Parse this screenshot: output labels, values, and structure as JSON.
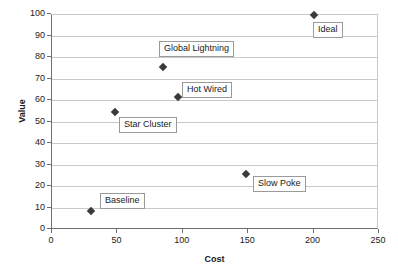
{
  "chart_data": {
    "type": "scatter",
    "title": "",
    "xlabel": "Cost",
    "ylabel": "Value",
    "xlim": [
      0,
      250
    ],
    "ylim": [
      0,
      100
    ],
    "xticks": [
      0,
      50,
      100,
      150,
      200,
      250
    ],
    "yticks": [
      0,
      10,
      20,
      30,
      40,
      50,
      60,
      70,
      80,
      90,
      100
    ],
    "grid": "horizontal",
    "legend": "none",
    "marker_color": "#3a3a3a",
    "gridline_color": "#c9c9c9",
    "axis_color": "#6e6e6e",
    "points": [
      {
        "label": "Baseline",
        "x": 30,
        "y": 9,
        "label_x": 100,
        "label_y": 193
      },
      {
        "label": "Star Cluster",
        "x": 48,
        "y": 55,
        "label_x": 119,
        "label_y": 117
      },
      {
        "label": "Global Lightning",
        "x": 85,
        "y": 76,
        "label_x": 159,
        "label_y": 41
      },
      {
        "label": "Hot Wired",
        "x": 96,
        "y": 62,
        "label_x": 182,
        "label_y": 82
      },
      {
        "label": "Slow Poke",
        "x": 148,
        "y": 26,
        "label_x": 253,
        "label_y": 176
      },
      {
        "label": "Ideal",
        "x": 200,
        "y": 100,
        "label_x": 313,
        "label_y": 22
      }
    ]
  }
}
